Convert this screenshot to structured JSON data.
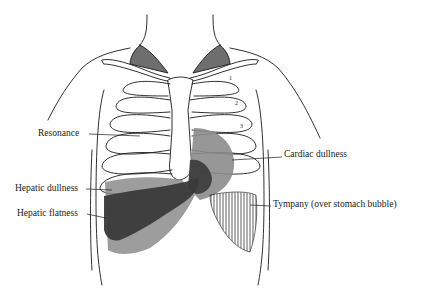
{
  "diagram": {
    "type": "anatomical-illustration",
    "colors": {
      "line": "#1a1a1a",
      "fill_light_gray": "#8c8c8c",
      "fill_dark_gray": "#3a3a3a",
      "fill_supraclavicular": "#6e6e6e",
      "background": "#ffffff"
    },
    "labels": [
      {
        "id": "resonance",
        "text": "Resonance",
        "x": 38,
        "y": 129,
        "side": "left"
      },
      {
        "id": "cardiac-dullness",
        "text": "Cardiac dullness",
        "x": 284,
        "y": 154,
        "side": "right"
      },
      {
        "id": "hepatic-dullness",
        "text": "Hepatic dullness",
        "x": 15,
        "y": 185,
        "side": "left"
      },
      {
        "id": "tympany",
        "text": "Tympany (over stomach bubble)",
        "x": 273,
        "y": 203,
        "side": "right"
      },
      {
        "id": "hepatic-flatness",
        "text": "Hepatic flatness",
        "x": 17,
        "y": 210,
        "side": "left"
      }
    ],
    "rib_numbers": [
      "1",
      "2",
      "3"
    ]
  }
}
